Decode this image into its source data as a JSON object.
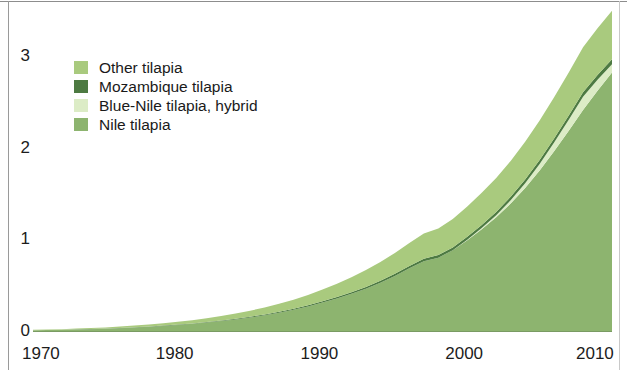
{
  "chart_data": {
    "type": "area",
    "stacked": true,
    "title": "",
    "subtitle": "",
    "xlabel": "",
    "ylabel": "",
    "xlim": [
      1970,
      2010
    ],
    "ylim": [
      0,
      3.6
    ],
    "grid": false,
    "legend_position": "inside-upper-left",
    "x_tick_labels": [
      "1970",
      "1980",
      "1990",
      "2000",
      "2010"
    ],
    "x_ticks": [
      1970,
      1980,
      1990,
      2000,
      2010
    ],
    "y_tick_labels": [
      "0",
      "1",
      "2",
      "3"
    ],
    "y_ticks": [
      0,
      1,
      2,
      3
    ],
    "x": [
      1970,
      1971,
      1972,
      1973,
      1974,
      1975,
      1976,
      1977,
      1978,
      1979,
      1980,
      1981,
      1982,
      1983,
      1984,
      1985,
      1986,
      1987,
      1988,
      1989,
      1990,
      1991,
      1992,
      1993,
      1994,
      1995,
      1996,
      1997,
      1998,
      1999,
      2000,
      2001,
      2002,
      2003,
      2004,
      2005,
      2006,
      2007,
      2008,
      2009,
      2010
    ],
    "series": [
      {
        "name": "Nile tilapia",
        "color": "#8db46f",
        "stack_order": 1,
        "values": [
          0.008,
          0.01,
          0.013,
          0.016,
          0.02,
          0.025,
          0.031,
          0.038,
          0.046,
          0.055,
          0.066,
          0.078,
          0.092,
          0.108,
          0.126,
          0.147,
          0.171,
          0.199,
          0.231,
          0.268,
          0.31,
          0.355,
          0.405,
          0.462,
          0.527,
          0.6,
          0.683,
          0.76,
          0.8,
          0.88,
          0.99,
          1.11,
          1.24,
          1.39,
          1.56,
          1.75,
          1.96,
          2.18,
          2.41,
          2.62,
          2.82
        ]
      },
      {
        "name": "Blue-Nile tilapia, hybrid",
        "color": "#dcecc6",
        "stack_order": 2,
        "values": [
          0.0,
          0.0,
          0.0,
          0.0,
          0.0,
          0.0,
          0.0,
          0.0,
          0.0,
          0.0,
          0.0,
          0.0,
          0.0,
          0.0,
          0.0,
          0.0,
          0.0,
          0.0,
          0.0,
          0.0,
          0.0,
          0.0,
          0.0,
          0.0,
          0.0,
          0.0,
          0.0,
          0.0,
          0.0,
          0.0,
          0.005,
          0.012,
          0.022,
          0.035,
          0.052,
          0.072,
          0.095,
          0.12,
          0.145,
          0.12,
          0.09
        ]
      },
      {
        "name": "Mozambique tilapia",
        "color": "#4d7a42",
        "stack_order": 3,
        "values": [
          0.001,
          0.001,
          0.001,
          0.002,
          0.002,
          0.002,
          0.003,
          0.003,
          0.004,
          0.004,
          0.005,
          0.005,
          0.006,
          0.007,
          0.008,
          0.009,
          0.01,
          0.011,
          0.012,
          0.013,
          0.015,
          0.016,
          0.018,
          0.019,
          0.021,
          0.023,
          0.025,
          0.027,
          0.029,
          0.031,
          0.033,
          0.035,
          0.037,
          0.039,
          0.041,
          0.043,
          0.045,
          0.047,
          0.049,
          0.051,
          0.053
        ]
      },
      {
        "name": "Other tilapia",
        "color": "#a9ca7e",
        "stack_order": 4,
        "values": [
          0.004,
          0.005,
          0.006,
          0.008,
          0.01,
          0.012,
          0.015,
          0.018,
          0.021,
          0.025,
          0.03,
          0.035,
          0.041,
          0.048,
          0.056,
          0.065,
          0.075,
          0.086,
          0.098,
          0.112,
          0.128,
          0.145,
          0.163,
          0.183,
          0.205,
          0.228,
          0.253,
          0.275,
          0.29,
          0.31,
          0.33,
          0.35,
          0.37,
          0.39,
          0.41,
          0.43,
          0.45,
          0.47,
          0.49,
          0.51,
          0.53
        ]
      }
    ],
    "legend": [
      {
        "label": "Other tilapia",
        "color": "#a9ca7e"
      },
      {
        "label": "Mozambique tilapia",
        "color": "#4d7a42"
      },
      {
        "label": "Blue-Nile tilapia, hybrid",
        "color": "#dcecc6"
      },
      {
        "label": "Nile tilapia",
        "color": "#8db46f"
      }
    ]
  }
}
